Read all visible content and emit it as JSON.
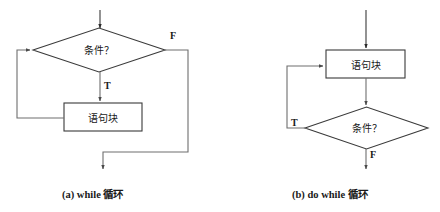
{
  "figure": {
    "background_color": "#ffffff",
    "line_color": "#6e6e6e",
    "shape_stroke_color": "#3a3a3a",
    "text_color": "#1a1a1a"
  },
  "diagrams": [
    {
      "id": "while-loop",
      "caption": "(a) while 循环",
      "nodes": [
        {
          "name": "condition-diamond",
          "shape": "diamond",
          "label": "条件？"
        },
        {
          "name": "statement-box",
          "shape": "rectangle",
          "label": "语句块"
        }
      ],
      "branch_labels": {
        "false": "F",
        "true": "T"
      },
      "edges": [
        {
          "from": "entry",
          "to": "condition-diamond"
        },
        {
          "from": "condition-diamond",
          "to": "statement-box",
          "label": "T"
        },
        {
          "from": "condition-diamond",
          "to": "exit",
          "label": "F"
        },
        {
          "from": "statement-box",
          "to": "condition-diamond",
          "label": ""
        }
      ]
    },
    {
      "id": "do-while-loop",
      "caption": "(b) do while 循环",
      "nodes": [
        {
          "name": "statement-box",
          "shape": "rectangle",
          "label": "语句块"
        },
        {
          "name": "condition-diamond",
          "shape": "diamond",
          "label": "条件？"
        }
      ],
      "branch_labels": {
        "true": "T",
        "false": "F"
      },
      "edges": [
        {
          "from": "entry",
          "to": "statement-box"
        },
        {
          "from": "statement-box",
          "to": "condition-diamond"
        },
        {
          "from": "condition-diamond",
          "to": "statement-box",
          "label": "T"
        },
        {
          "from": "condition-diamond",
          "to": "exit",
          "label": "F"
        }
      ]
    }
  ]
}
